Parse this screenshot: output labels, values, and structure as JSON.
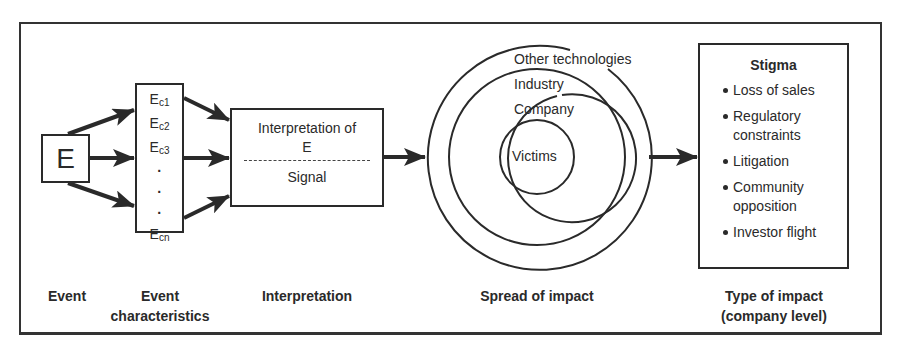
{
  "diagram": {
    "event_box": {
      "label": "E"
    },
    "event_characteristics_box": {
      "items": [
        {
          "base": "E",
          "sub": "c1"
        },
        {
          "base": "E",
          "sub": "c2"
        },
        {
          "base": "E",
          "sub": "c3"
        },
        {
          "base": "E",
          "sub": "cn"
        }
      ],
      "ellipsis": [
        "·",
        "·",
        "·"
      ]
    },
    "interpretation_box": {
      "top_line1": "Interpretation of",
      "top_line2": "E",
      "bottom": "Signal"
    },
    "spread_circles": [
      {
        "label": "Victims"
      },
      {
        "label": "Company"
      },
      {
        "label": "Industry"
      },
      {
        "label": "Other technologies"
      }
    ],
    "stigma_box": {
      "title": "Stigma",
      "items": [
        "Loss of sales",
        "Regulatory constraints",
        "Litigation",
        "Community opposition",
        "Investor flight"
      ]
    },
    "stage_labels": [
      {
        "line1": "Event",
        "line2": ""
      },
      {
        "line1": "Event",
        "line2": "characteristics"
      },
      {
        "line1": "Interpretation",
        "line2": ""
      },
      {
        "line1": "Spread of impact",
        "line2": ""
      },
      {
        "line1": "Type of impact",
        "line2": "(company level)"
      }
    ],
    "colors": {
      "stroke": "#2a2a2a",
      "background": "#ffffff"
    }
  }
}
